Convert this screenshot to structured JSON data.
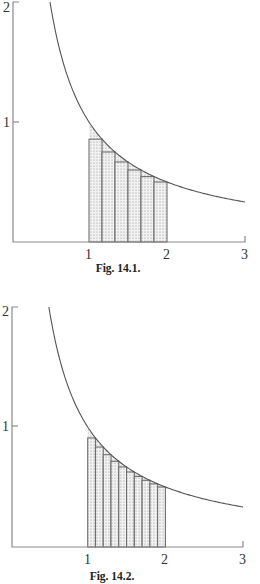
{
  "chart_data": [
    {
      "type": "area",
      "title": "Fig. 14.1.",
      "function": "y = 1/x",
      "curve_domain": [
        0.5,
        3
      ],
      "shaded_interval": [
        1,
        2
      ],
      "rectangles": {
        "count": 6,
        "rule": "right-endpoint (lower sum)",
        "x_edges": [
          1,
          1.1667,
          1.3333,
          1.5,
          1.6667,
          1.8333,
          2
        ],
        "heights": [
          0.857,
          0.75,
          0.667,
          0.6,
          0.545,
          0.5
        ]
      },
      "xlabel": "",
      "ylabel": "",
      "x_ticks": [
        "1",
        "2",
        "3"
      ],
      "y_ticks": [
        "1",
        "2"
      ],
      "xlim": [
        0,
        3
      ],
      "ylim": [
        0,
        2
      ],
      "grid": false
    },
    {
      "type": "area",
      "title": "Fig. 14.2.",
      "function": "y = 1/x",
      "curve_domain": [
        0.5,
        3
      ],
      "shaded_interval": [
        1,
        2
      ],
      "rectangles": {
        "count": 10,
        "rule": "right-endpoint (lower sum)",
        "x_edges": [
          1,
          1.1,
          1.2,
          1.3,
          1.4,
          1.5,
          1.6,
          1.7,
          1.8,
          1.9,
          2
        ],
        "heights": [
          0.909,
          0.833,
          0.769,
          0.714,
          0.667,
          0.625,
          0.588,
          0.556,
          0.526,
          0.5
        ]
      },
      "xlabel": "",
      "ylabel": "",
      "x_ticks": [
        "1",
        "2",
        "3"
      ],
      "y_ticks": [
        "1",
        "2"
      ],
      "xlim": [
        0,
        3
      ],
      "ylim": [
        0,
        2
      ],
      "grid": false
    }
  ],
  "figures": [
    {
      "caption": "Fig. 14.1.",
      "x_tick_labels": [
        "1",
        "2",
        "3"
      ],
      "y_tick_labels": [
        "1",
        "2"
      ]
    },
    {
      "caption": "Fig. 14.2.",
      "x_tick_labels": [
        "1",
        "2",
        "3"
      ],
      "y_tick_labels": [
        "1",
        "2"
      ]
    }
  ]
}
